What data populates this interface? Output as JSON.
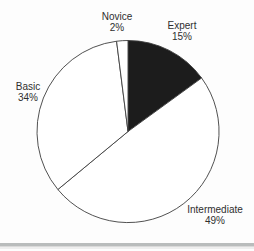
{
  "page": {
    "background_color": "#fdfdfd"
  },
  "chart_data": {
    "type": "pie",
    "title": "",
    "direction": "clockwise",
    "start_angle_deg": -90,
    "legend": "none",
    "categories": [
      "Expert",
      "Intermediate",
      "Basic",
      "Novice"
    ],
    "values": [
      15,
      49,
      34,
      2
    ],
    "slices": [
      {
        "label": "Expert",
        "value": 15,
        "pct_label": "15%",
        "color": "#1c1c1c"
      },
      {
        "label": "Intermediate",
        "value": 49,
        "pct_label": "49%",
        "color": "#ffffff"
      },
      {
        "label": "Basic",
        "value": 34,
        "pct_label": "34%",
        "color": "#ffffff"
      },
      {
        "label": "Novice",
        "value": 2,
        "pct_label": "2%",
        "color": "#ffffff"
      }
    ],
    "outline_color": "#3d3d3d",
    "label_color": "#2f2f2f"
  },
  "divider": {
    "color_top": "#b9bcbc",
    "color_bottom": "#eeeeee"
  }
}
